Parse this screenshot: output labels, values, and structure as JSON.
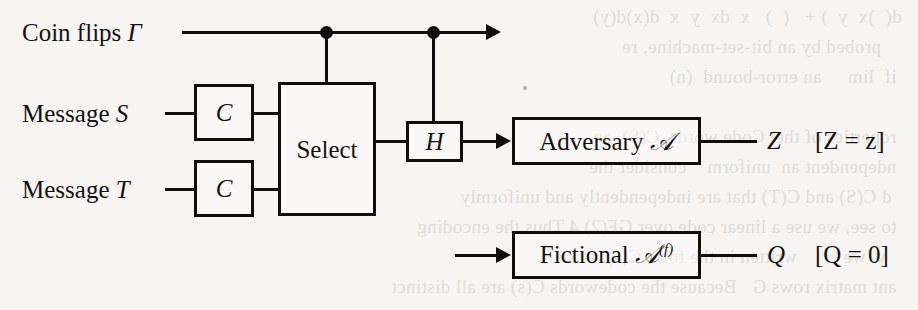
{
  "figure": {
    "type": "block-diagram",
    "caption_present": false,
    "background_note": "scanned book page with faint mirrored bleed-through text"
  },
  "inputs": [
    {
      "id": "coin-flips",
      "label_text": "Coin flips",
      "label_symbol": "Γ"
    },
    {
      "id": "message-s",
      "label_text": "Message",
      "label_symbol": "S"
    },
    {
      "id": "message-t",
      "label_text": "Message",
      "label_symbol": "T"
    }
  ],
  "blocks": [
    {
      "id": "encoder-s",
      "label": "C"
    },
    {
      "id": "encoder-t",
      "label": "C"
    },
    {
      "id": "select",
      "label": "Select"
    },
    {
      "id": "channel-h",
      "label": "H"
    },
    {
      "id": "adversary",
      "label_text": "Adversary",
      "label_symbol": "𝒜",
      "label_sup": ""
    },
    {
      "id": "fictional-adversary",
      "label_text": "Fictional",
      "label_symbol": "𝒜",
      "label_sup": "(f)"
    }
  ],
  "outputs": [
    {
      "id": "adversary-output",
      "symbol": "Z",
      "condition": "[Z = z]"
    },
    {
      "id": "fictional-output",
      "symbol": "Q",
      "condition": "[Q = 0]"
    }
  ],
  "junctions": [
    {
      "id": "tap-select",
      "feeds": "select"
    },
    {
      "id": "tap-h",
      "feeds": "channel-h"
    }
  ],
  "bleed_text": "  d(  )x  y  ) +   (  )   x  dx  y  x  d(x)d(y)\n      probed by an bit-set-machine, re\n   if  lim     an error-bound  (n)\n\n   roperties of the  Code words  C(S)  an\n   ndependent an  uniform    consider the\n    d C(S) and C(T) that are independently and uniformly\n   to see, we use a linear code over GF(2) 4 Thus the encoding\n     y  we         written in the form C(s)  =  s G\n   ant matrix rows G   Because the codewords C(s) are all distinct"
}
